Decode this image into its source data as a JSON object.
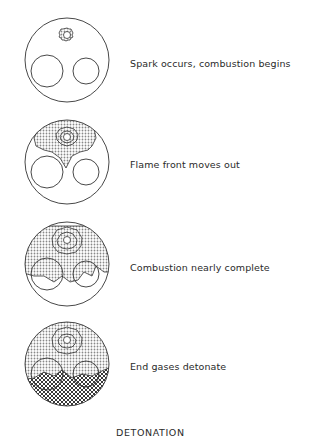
{
  "title": "DETONATION",
  "stages": [
    {
      "label": "Spark occurs, combustion begins",
      "y": 58
    },
    {
      "label": "Flame front moves out",
      "y": 159
    },
    {
      "label": "Combustion nearly complete",
      "y": 262
    },
    {
      "label": "End gases detonate",
      "y": 361
    }
  ],
  "colors": {
    "line": "#333333",
    "shade": "#bdbdbd"
  }
}
